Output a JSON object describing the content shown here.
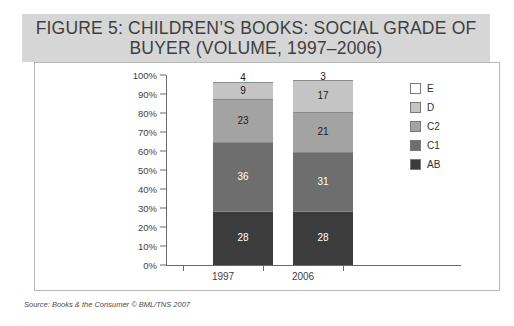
{
  "figure": {
    "title": "FIGURE 5: CHILDREN’S BOOKS: SOCIAL GRADE OF BUYER (VOLUME, 1997–2006)",
    "source": "Source: Books & the Consumer © BML/TNS 2007",
    "banner_color": "#d6d6d6",
    "panel_border_color": "#b9b9b9"
  },
  "chart_data": {
    "type": "bar",
    "stacked": true,
    "stack_mode": "percent",
    "title": "FIGURE 5: CHILDREN’S BOOKS: SOCIAL GRADE OF BUYER (VOLUME, 1997–2006)",
    "xlabel": "",
    "ylabel": "",
    "categories": [
      "1997",
      "2006"
    ],
    "ylim": [
      0,
      100
    ],
    "ytick_labels": [
      "0%",
      "10%",
      "20%",
      "30%",
      "40%",
      "50%",
      "60%",
      "70%",
      "80%",
      "90%",
      "100%"
    ],
    "ytick_values": [
      0,
      10,
      20,
      30,
      40,
      50,
      60,
      70,
      80,
      90,
      100
    ],
    "grid": false,
    "legend_position": "right",
    "series": [
      {
        "name": "AB",
        "values": [
          28,
          28
        ],
        "color": "#3c3c3c",
        "label_color": "#ffffff"
      },
      {
        "name": "C1",
        "values": [
          36,
          31
        ],
        "color": "#6e6e6e",
        "label_color": "#ffffff"
      },
      {
        "name": "C2",
        "values": [
          23,
          21
        ],
        "color": "#a3a3a3",
        "label_color": "#1c1c1c"
      },
      {
        "name": "D",
        "values": [
          9,
          17
        ],
        "color": "#c4c4c4",
        "label_color": "#1c1c1c"
      },
      {
        "name": "E",
        "values": [
          4,
          3
        ],
        "color": "#ffffff",
        "label_color": "#1c1c1c"
      }
    ],
    "legend_order": [
      "E",
      "D",
      "C2",
      "C1",
      "AB"
    ]
  }
}
